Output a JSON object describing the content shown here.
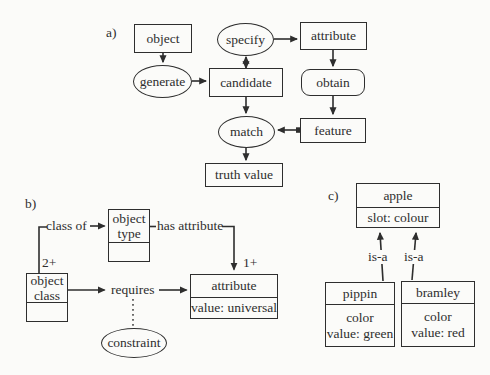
{
  "colors": {
    "bg": "#fbfbf9",
    "ink": "#2e2e2e"
  },
  "sections": {
    "a": {
      "label": "a)",
      "nodes": {
        "object": "object",
        "specify": "specify",
        "attribute": "attribute",
        "generate": "generate",
        "candidate": "candidate",
        "obtain": "obtain",
        "match": "match",
        "feature": "feature",
        "truth_value": "truth value"
      }
    },
    "b": {
      "label": "b)",
      "nodes": {
        "object_type": {
          "title": "object\ntype",
          "value": ""
        },
        "object_class": {
          "title": "object\nclass",
          "value": ""
        },
        "attribute": {
          "title": "attribute",
          "value": "value: universal"
        },
        "constraint": "constraint"
      },
      "edges": {
        "class_of": "class of",
        "has_attribute": "has attribute",
        "requires": "requires",
        "mult_object_class": "2+",
        "mult_attribute": "1+"
      }
    },
    "c": {
      "label": "c)",
      "nodes": {
        "apple": {
          "title": "apple",
          "value": "slot: colour"
        },
        "pippin": {
          "title": "pippin",
          "value": "color\nvalue: green"
        },
        "bramley": {
          "title": "bramley",
          "value": "color\nvalue: red"
        }
      },
      "edges": {
        "isa_left": "is-a",
        "isa_right": "is-a"
      }
    }
  }
}
